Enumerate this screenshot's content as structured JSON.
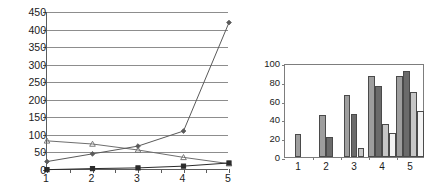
{
  "page": {
    "background_color": "#ffffff"
  },
  "chart_data": [
    {
      "id": "line-chart",
      "type": "line",
      "title": "",
      "xlabel": "",
      "ylabel": "",
      "x": [
        1,
        2,
        3,
        4,
        5
      ],
      "xtick_labels": [
        "1",
        "2",
        "3",
        "4",
        "5"
      ],
      "ytick_labels": [
        "0",
        "50",
        "100",
        "150",
        "200",
        "250",
        "300",
        "350",
        "400",
        "450"
      ],
      "ylim": [
        0,
        450
      ],
      "ytick_step": 50,
      "xlim": [
        1,
        5
      ],
      "grid": "horizontal",
      "legend": "none",
      "series": [
        {
          "name": "series-1",
          "marker": "triangle",
          "color": "#6e6e6e",
          "values": [
            83,
            74,
            57,
            36,
            18
          ]
        },
        {
          "name": "series-2",
          "marker": "diamond",
          "color": "#5a5a5a",
          "values": [
            24,
            46,
            68,
            111,
            420
          ]
        },
        {
          "name": "series-3",
          "marker": "square",
          "color": "#2b2b2b",
          "values": [
            1,
            4,
            6,
            11,
            20
          ]
        }
      ]
    },
    {
      "id": "bar-chart",
      "type": "bar",
      "title": "",
      "xlabel": "",
      "ylabel": "",
      "categories": [
        "1",
        "2",
        "3",
        "4",
        "5"
      ],
      "xtick_labels": [
        "1",
        "2",
        "3",
        "4",
        "5"
      ],
      "ytick_labels": [
        "0",
        "20",
        "40",
        "60",
        "80",
        "100"
      ],
      "ylim": [
        0,
        100
      ],
      "ytick_step": 20,
      "grid": "off",
      "legend": "none",
      "series": [
        {
          "name": "bar-series-1",
          "color": "#9e9e9e",
          "values": [
            24,
            45,
            66,
            86,
            86
          ]
        },
        {
          "name": "bar-series-2",
          "color": "#6b6b6b",
          "values": [
            null,
            21,
            46,
            76,
            91
          ]
        },
        {
          "name": "bar-series-3",
          "color": "#c6c6c6",
          "values": [
            null,
            null,
            10,
            35,
            69
          ]
        },
        {
          "name": "bar-series-4",
          "color": "#f3f3f3",
          "values": [
            null,
            null,
            null,
            26,
            49
          ]
        }
      ]
    }
  ]
}
